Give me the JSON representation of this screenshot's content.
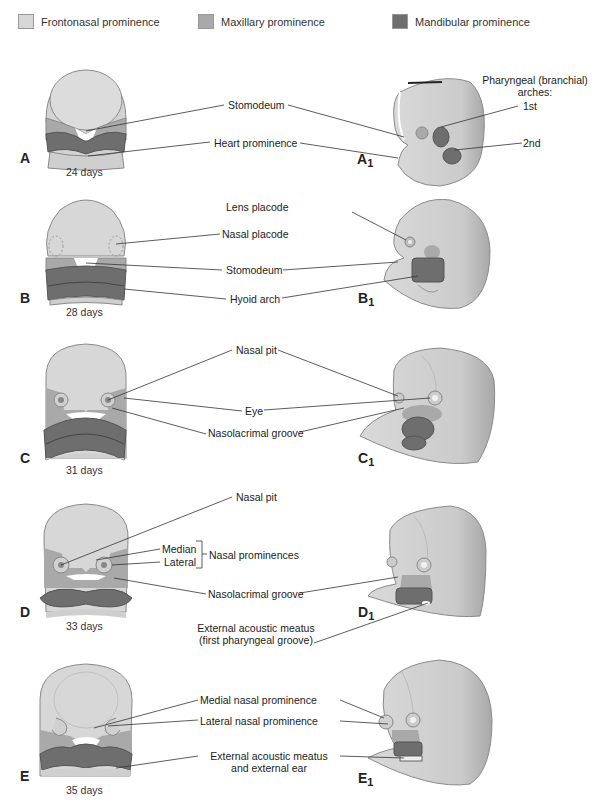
{
  "legend": [
    {
      "label": "Frontonasal prominence",
      "color": "#d7d7d7"
    },
    {
      "label": "Maxillary prominence",
      "color": "#a9a9a9"
    },
    {
      "label": "Mandibular prominence",
      "color": "#6e6e6e"
    }
  ],
  "colors": {
    "frontonasal": "#d7d7d7",
    "maxillary": "#a9a9a9",
    "mandibular": "#6e6e6e",
    "skin": "#cfcfcf",
    "skin_dark": "#b5b5b5",
    "outline": "#8a8a8a",
    "leader": "#333333"
  },
  "panels": [
    {
      "id": "A",
      "frontal_letter": "A",
      "lateral_letter": "A",
      "lateral_sub": "1",
      "age": "24 days",
      "labels": [
        "Stomodeum",
        "Heart prominence"
      ],
      "lateral_labels": [
        "Pharyngeal (branchial)",
        "arches:",
        "1st",
        "2nd"
      ]
    },
    {
      "id": "B",
      "frontal_letter": "B",
      "lateral_letter": "B",
      "lateral_sub": "1",
      "age": "28 days",
      "labels": [
        "Lens placode",
        "Nasal placode",
        "Stomodeum",
        "Hyoid arch"
      ]
    },
    {
      "id": "C",
      "frontal_letter": "C",
      "lateral_letter": "C",
      "lateral_sub": "1",
      "age": "31 days",
      "labels": [
        "Nasal pit",
        "Eye",
        "Nasolacrimal groove"
      ]
    },
    {
      "id": "D",
      "frontal_letter": "D",
      "lateral_letter": "D",
      "lateral_sub": "1",
      "age": "33 days",
      "labels": [
        "Nasal pit",
        "Median",
        "Lateral",
        "Nasal prominences",
        "Nasolacrimal groove",
        "External acoustic meatus",
        "(first pharyngeal groove)"
      ]
    },
    {
      "id": "E",
      "frontal_letter": "E",
      "lateral_letter": "E",
      "lateral_sub": "1",
      "age": "35 days",
      "labels": [
        "Medial nasal prominence",
        "Lateral nasal prominence",
        "External acoustic meatus",
        "and external ear"
      ]
    }
  ]
}
